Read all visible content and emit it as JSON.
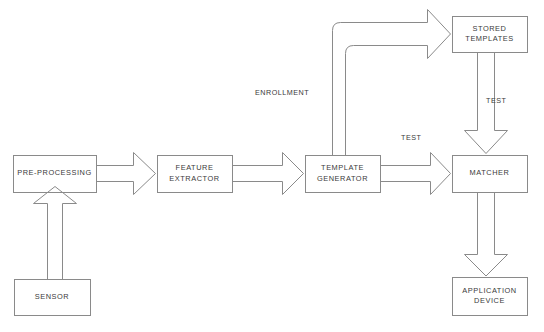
{
  "diagram": {
    "type": "block-flow-diagram",
    "stroke_color": "#8a8a8a",
    "text_color": "#3a3a3a",
    "background": "#ffffff",
    "nodes": [
      {
        "id": "sensor",
        "label": "SENSOR",
        "x": 14,
        "y": 279,
        "w": 76,
        "h": 36
      },
      {
        "id": "preprocessing",
        "label": "PRE-PROCESSING",
        "x": 13,
        "y": 155,
        "w": 83,
        "h": 37
      },
      {
        "id": "feature",
        "label": "FEATURE\nEXTRACTOR",
        "x": 157,
        "y": 155,
        "w": 75,
        "h": 37
      },
      {
        "id": "template",
        "label": "TEMPLATE\nGENERATOR",
        "x": 305,
        "y": 155,
        "w": 75,
        "h": 37
      },
      {
        "id": "stored",
        "label": "STORED\nTEMPLATES",
        "x": 452,
        "y": 16,
        "w": 75,
        "h": 36
      },
      {
        "id": "matcher",
        "label": "MATCHER",
        "x": 452,
        "y": 155,
        "w": 75,
        "h": 37
      },
      {
        "id": "application",
        "label": "APPLICATION\nDEVICE",
        "x": 452,
        "y": 277,
        "w": 75,
        "h": 38
      }
    ],
    "edge_labels": [
      {
        "id": "enrollment",
        "text": "ENROLLMENT",
        "x": 255,
        "y": 88
      },
      {
        "id": "test-middle",
        "text": "TEST",
        "x": 401,
        "y": 133
      },
      {
        "id": "test-right",
        "text": "TEST",
        "x": 486,
        "y": 96
      }
    ],
    "edges": [
      {
        "id": "sensor-to-preprocessing",
        "from": "sensor",
        "to": "preprocessing",
        "style": "block-arrow",
        "direction": "up"
      },
      {
        "id": "preprocessing-to-feature",
        "from": "preprocessing",
        "to": "feature",
        "style": "block-arrow",
        "direction": "right"
      },
      {
        "id": "feature-to-template",
        "from": "feature",
        "to": "template",
        "style": "block-arrow",
        "direction": "right"
      },
      {
        "id": "template-to-stored",
        "from": "template",
        "to": "stored",
        "style": "block-arrow",
        "direction": "up-right",
        "label": "ENROLLMENT"
      },
      {
        "id": "template-to-matcher",
        "from": "template",
        "to": "matcher",
        "style": "block-arrow",
        "direction": "right",
        "label": "TEST"
      },
      {
        "id": "stored-to-matcher",
        "from": "stored",
        "to": "matcher",
        "style": "block-arrow",
        "direction": "down",
        "label": "TEST"
      },
      {
        "id": "matcher-to-application",
        "from": "matcher",
        "to": "application",
        "style": "block-arrow",
        "direction": "down"
      }
    ]
  }
}
